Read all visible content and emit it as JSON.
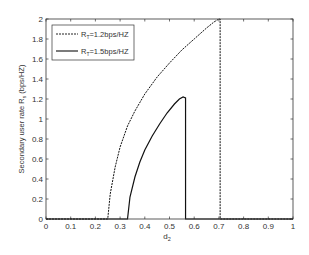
{
  "chart_data": {
    "type": "line",
    "title": "",
    "xlabel": "d₂",
    "ylabel": "Secondary user rate Rₛ (bps/HZ)",
    "xlim": [
      0,
      1
    ],
    "ylim": [
      0,
      2
    ],
    "grid": false,
    "legend_position": "upper left",
    "x_ticks": [
      "0",
      "0.1",
      "0.2",
      "0.3",
      "0.4",
      "0.5",
      "0.6",
      "0.7",
      "0.8",
      "0.9",
      "1"
    ],
    "y_ticks": [
      "0",
      "0.2",
      "0.4",
      "0.6",
      "0.8",
      "1",
      "1.2",
      "1.4",
      "1.6",
      "1.8",
      "2"
    ],
    "series": [
      {
        "name": "R_T=1.2bps/HZ",
        "style": "dashed",
        "x": [
          0,
          0.25,
          0.26,
          0.28,
          0.3,
          0.33,
          0.36,
          0.4,
          0.45,
          0.5,
          0.55,
          0.6,
          0.65,
          0.68,
          0.7,
          0.705,
          0.705,
          1.0
        ],
        "y": [
          0,
          0,
          0.25,
          0.52,
          0.72,
          0.93,
          1.08,
          1.25,
          1.42,
          1.56,
          1.69,
          1.8,
          1.91,
          1.97,
          2.0,
          2.0,
          0,
          0
        ]
      },
      {
        "name": "R_T=1.5bps/HZ",
        "style": "solid",
        "x": [
          0,
          0.33,
          0.34,
          0.36,
          0.38,
          0.4,
          0.43,
          0.46,
          0.49,
          0.52,
          0.54,
          0.555,
          0.565,
          0.565,
          1.0
        ],
        "y": [
          0,
          0,
          0.22,
          0.42,
          0.57,
          0.69,
          0.83,
          0.95,
          1.06,
          1.15,
          1.2,
          1.22,
          1.21,
          0,
          0
        ]
      }
    ]
  },
  "legend": [
    {
      "label_main": "R",
      "label_sub": "T",
      "label_rest": "=1.2bps/HZ"
    },
    {
      "label_main": "R",
      "label_sub": "T",
      "label_rest": "=1.5bps/HZ"
    }
  ],
  "axes": {
    "xlabel_main": "d",
    "xlabel_sub": "2",
    "ylabel_main": "Secondary user rate R",
    "ylabel_sub": "s",
    "ylabel_rest": " (bps/HZ)"
  }
}
